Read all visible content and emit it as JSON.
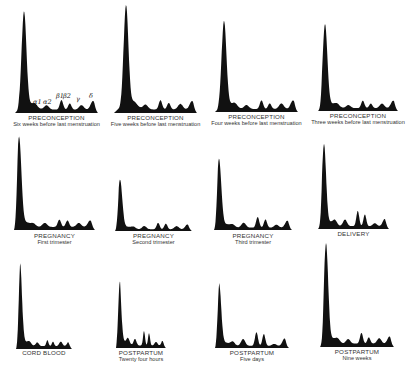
{
  "figure": {
    "fill_color": "#111111",
    "background": "#ffffff",
    "peak_labels": [
      "α1",
      "α2",
      "β1",
      "β2",
      "γ",
      "δ"
    ]
  },
  "panels": [
    {
      "title": "PRECONCEPTION",
      "subtitle": "Six weeks before last menstruation"
    },
    {
      "title": "PRECONCEPTION",
      "subtitle": "Five weeks before last menstruation"
    },
    {
      "title": "PRECONCEPTION",
      "subtitle": "Four weeks before last menstruation"
    },
    {
      "title": "PRECONCEPTION",
      "subtitle": "Three weeks before last menstruation"
    },
    {
      "title": "PREGNANCY",
      "subtitle": "First trimester"
    },
    {
      "title": "PREGNANCY",
      "subtitle": "Second trimester"
    },
    {
      "title": "PREGNANCY",
      "subtitle": "Third trimester"
    },
    {
      "title": "DELIVERY",
      "subtitle": ""
    },
    {
      "title": "CORD BLOOD",
      "subtitle": ""
    },
    {
      "title": "POSTPARTUM",
      "subtitle": "Twenty four hours"
    },
    {
      "title": "POSTPARTUM",
      "subtitle": "Five days"
    },
    {
      "title": "POSTPARTUM",
      "subtitle": "Nine weeks"
    }
  ],
  "chart_data": {
    "type": "area",
    "xlabel": "",
    "ylabel": "",
    "grid": false,
    "legend": "none",
    "fractions": [
      "Albumin",
      "α1",
      "α2",
      "β1",
      "β2",
      "γ",
      "δ"
    ],
    "layout": {
      "rows": 3,
      "cols": 4
    },
    "series": [
      {
        "name": "Preconception – Six weeks before last menstruation",
        "values": [
          1.0,
          0.06,
          0.1,
          0.22,
          0.14,
          0.1,
          0.2
        ]
      },
      {
        "name": "Preconception – Five weeks before last menstruation",
        "values": [
          1.0,
          0.06,
          0.1,
          0.2,
          0.14,
          0.12,
          0.18
        ]
      },
      {
        "name": "Preconception – Four weeks before last menstruation",
        "values": [
          1.0,
          0.07,
          0.1,
          0.22,
          0.14,
          0.14,
          0.22
        ]
      },
      {
        "name": "Preconception – Three weeks before last menstruation",
        "values": [
          1.0,
          0.07,
          0.08,
          0.2,
          0.12,
          0.12,
          0.2
        ]
      },
      {
        "name": "Pregnancy – First trimester",
        "values": [
          1.0,
          0.06,
          0.1,
          0.18,
          0.16,
          0.1,
          0.16
        ]
      },
      {
        "name": "Pregnancy – Second trimester",
        "values": [
          0.55,
          0.05,
          0.08,
          0.16,
          0.14,
          0.08,
          0.12
        ]
      },
      {
        "name": "Pregnancy – Third trimester",
        "values": [
          0.75,
          0.06,
          0.12,
          0.26,
          0.2,
          0.07,
          0.17
        ]
      },
      {
        "name": "Delivery",
        "values": [
          1.0,
          0.12,
          0.18,
          0.42,
          0.32,
          0.08,
          0.2
        ]
      },
      {
        "name": "Cord blood",
        "values": [
          1.0,
          0.06,
          0.1,
          0.16,
          0.12,
          0.12,
          0.12
        ]
      },
      {
        "name": "Postpartum – Twenty four hours",
        "values": [
          0.9,
          0.14,
          0.18,
          0.4,
          0.34,
          0.1,
          0.16
        ]
      },
      {
        "name": "Postpartum – Five days",
        "values": [
          0.9,
          0.12,
          0.22,
          0.44,
          0.38,
          0.06,
          0.24
        ]
      },
      {
        "name": "Postpartum – Nine weeks",
        "values": [
          1.0,
          0.07,
          0.1,
          0.24,
          0.14,
          0.12,
          0.16
        ]
      }
    ]
  }
}
